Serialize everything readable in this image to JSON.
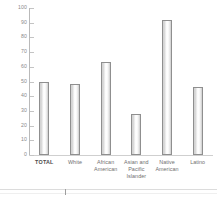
{
  "chart_data": {
    "type": "bar",
    "title": "",
    "subtitle": "",
    "xlabel": "",
    "ylabel": "",
    "categories": [
      "TOTAL",
      "White",
      "African American",
      "Asian and Pacific Islander",
      "Native American",
      "Latino"
    ],
    "category_lines": [
      [
        "TOTAL"
      ],
      [
        "White"
      ],
      [
        "African",
        "American"
      ],
      [
        "Asian and",
        "Pacific",
        "Islander"
      ],
      [
        "Native",
        "American"
      ],
      [
        "Latino"
      ]
    ],
    "values": [
      50,
      48,
      63,
      28,
      92,
      46
    ],
    "ylim": [
      0,
      100
    ],
    "ytick_values": [
      100,
      90,
      80,
      70,
      60,
      50,
      40,
      30,
      20,
      10,
      0
    ],
    "ytick_labels": [
      "100",
      "90",
      "80",
      "70",
      "60",
      "50",
      "40",
      "30",
      "20",
      "10",
      "0"
    ],
    "grid": false,
    "legend": null,
    "legend_position": "none",
    "emphasized_category": "TOTAL",
    "colors": {
      "bar_border": "#8f8f8f",
      "bar_fill_light": "#ffffff",
      "bar_fill_shadow": "#d2d2d2",
      "axis_line": "#b9b9b9",
      "baseline": "#cfcfcf",
      "tick_label": "#8a8a8a",
      "category_label": "#6f6f6f",
      "background": "#ffffff"
    }
  },
  "bottom_strip": {
    "divider_color": "#dcdcdc",
    "tick_color": "#9e9e9e"
  }
}
